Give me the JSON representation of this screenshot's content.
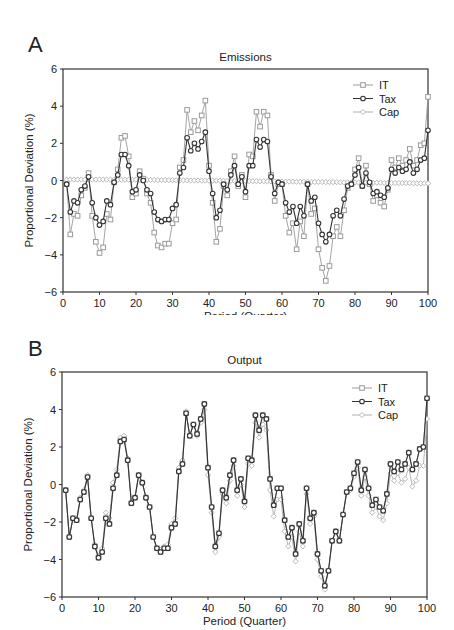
{
  "chart_data": [
    {
      "panel": "A",
      "type": "line",
      "title": "Emissions",
      "xlabel": "Period (Quarter)",
      "ylabel": "Proportional Deviation (%)",
      "xlim": [
        0,
        100
      ],
      "ylim": [
        -6,
        6
      ],
      "xticks": [
        0,
        10,
        20,
        30,
        40,
        50,
        60,
        70,
        80,
        90,
        100
      ],
      "yticks": [
        -6,
        -4,
        -2,
        0,
        2,
        4,
        6
      ],
      "grid": false,
      "legend_position": "upper right",
      "x": [
        1,
        2,
        3,
        4,
        5,
        6,
        7,
        8,
        9,
        10,
        11,
        12,
        13,
        14,
        15,
        16,
        17,
        18,
        19,
        20,
        21,
        22,
        23,
        24,
        25,
        26,
        27,
        28,
        29,
        30,
        31,
        32,
        33,
        34,
        35,
        36,
        37,
        38,
        39,
        40,
        41,
        42,
        43,
        44,
        45,
        46,
        47,
        48,
        49,
        50,
        51,
        52,
        53,
        54,
        55,
        56,
        57,
        58,
        59,
        60,
        61,
        62,
        63,
        64,
        65,
        66,
        67,
        68,
        69,
        70,
        71,
        72,
        73,
        74,
        75,
        76,
        77,
        78,
        79,
        80,
        81,
        82,
        83,
        84,
        85,
        86,
        87,
        88,
        89,
        90,
        91,
        92,
        93,
        94,
        95,
        96,
        97,
        98,
        99,
        100
      ],
      "series": [
        {
          "name": "IT",
          "marker": "square",
          "color": "#9a9a9a",
          "values": [
            -0.2,
            -2.9,
            -1.8,
            -1.9,
            -0.8,
            -0.4,
            0.4,
            -1.9,
            -3.3,
            -3.9,
            -3.6,
            -1.8,
            -2.1,
            -0.1,
            0.6,
            2.3,
            2.4,
            1.3,
            -0.9,
            -0.7,
            0.5,
            0.1,
            -0.7,
            -1.2,
            -2.8,
            -3.5,
            -3.6,
            -3.4,
            -3.4,
            -2.3,
            -2.1,
            0.7,
            1.1,
            3.8,
            2.6,
            3.2,
            2.7,
            3.5,
            4.3,
            0.8,
            -1.2,
            -3.3,
            -2.6,
            -0.3,
            -0.8,
            0.5,
            1.3,
            -0.3,
            0.3,
            -0.9,
            1.4,
            1.3,
            3.7,
            2.9,
            3.7,
            3.5,
            0.3,
            -1.1,
            -0.2,
            -0.2,
            -1.9,
            -2.8,
            -2.3,
            -3.7,
            -2.2,
            -3.0,
            -0.2,
            -1.8,
            -1.5,
            -3.7,
            -4.7,
            -5.4,
            -4.6,
            -3.0,
            -2.5,
            -3.0,
            -1.6,
            -0.4,
            -0.2,
            0.6,
            1.2,
            -0.3,
            0.8,
            -0.2,
            -1.1,
            -0.8,
            -1.2,
            -1.4,
            -0.5,
            1.1,
            0.7,
            1.2,
            0.8,
            1.1,
            1.7,
            0.8,
            1.1,
            1.9,
            2.0,
            4.5
          ]
        },
        {
          "name": "Tax",
          "marker": "circle",
          "color": "#333333",
          "values": [
            -0.2,
            -1.7,
            -1.1,
            -1.2,
            -0.5,
            -0.3,
            0.2,
            -1.2,
            -2.0,
            -2.4,
            -2.2,
            -1.1,
            -1.3,
            -0.1,
            0.3,
            1.4,
            1.4,
            0.8,
            -0.6,
            -0.5,
            0.3,
            0.0,
            -0.5,
            -0.7,
            -1.7,
            -2.1,
            -2.2,
            -2.1,
            -2.1,
            -1.5,
            -1.3,
            0.4,
            0.7,
            2.3,
            1.6,
            2.0,
            1.7,
            2.1,
            2.6,
            0.5,
            -0.7,
            -2.0,
            -1.6,
            -0.2,
            -0.5,
            0.3,
            0.8,
            -0.2,
            0.2,
            -0.6,
            0.8,
            0.8,
            2.2,
            1.8,
            2.2,
            2.1,
            0.2,
            -0.7,
            -0.1,
            -0.2,
            -1.2,
            -1.7,
            -1.4,
            -2.3,
            -1.4,
            -1.9,
            -0.2,
            -1.1,
            -0.9,
            -2.3,
            -2.9,
            -3.3,
            -2.9,
            -1.9,
            -1.6,
            -1.9,
            -1.0,
            -0.3,
            -0.2,
            0.3,
            0.7,
            -0.3,
            0.4,
            -0.1,
            -0.7,
            -0.6,
            -0.8,
            -0.9,
            -0.4,
            0.6,
            0.4,
            0.7,
            0.5,
            0.6,
            1.0,
            0.4,
            0.6,
            1.1,
            1.2,
            2.7
          ]
        },
        {
          "name": "Cap",
          "marker": "diamond",
          "color": "#b0b0b0",
          "values": [
            0.05,
            0.05,
            0.05,
            0.05,
            0.05,
            0.05,
            0.05,
            0.05,
            0.05,
            0.05,
            0.05,
            0.05,
            0.05,
            0.04,
            0.04,
            0.04,
            0.04,
            0.04,
            0.04,
            0.04,
            0.03,
            0.03,
            0.03,
            0.03,
            0.03,
            0.02,
            0.02,
            0.02,
            0.02,
            0.02,
            0.01,
            0.01,
            0.01,
            0.01,
            0.0,
            0.0,
            0.0,
            0.0,
            0.0,
            -0.01,
            -0.01,
            -0.01,
            -0.01,
            -0.02,
            -0.02,
            -0.02,
            -0.02,
            -0.03,
            -0.03,
            -0.03,
            -0.03,
            -0.04,
            -0.04,
            -0.04,
            -0.04,
            -0.05,
            -0.05,
            -0.05,
            -0.05,
            -0.06,
            -0.06,
            -0.06,
            -0.06,
            -0.07,
            -0.07,
            -0.07,
            -0.07,
            -0.08,
            -0.08,
            -0.08,
            -0.08,
            -0.09,
            -0.09,
            -0.09,
            -0.09,
            -0.1,
            -0.1,
            -0.1,
            -0.1,
            -0.11,
            -0.11,
            -0.11,
            -0.11,
            -0.12,
            -0.12,
            -0.12,
            -0.12,
            -0.13,
            -0.13,
            -0.13,
            -0.13,
            -0.14,
            -0.14,
            -0.14,
            -0.14,
            -0.15,
            -0.15,
            -0.15,
            -0.15,
            -0.15
          ]
        }
      ]
    },
    {
      "panel": "B",
      "type": "line",
      "title": "Output",
      "xlabel": "Period (Quarter)",
      "ylabel": "Proportional Deviation (%)",
      "xlim": [
        0,
        100
      ],
      "ylim": [
        -6,
        6
      ],
      "xticks": [
        0,
        10,
        20,
        30,
        40,
        50,
        60,
        70,
        80,
        90,
        100
      ],
      "yticks": [
        -6,
        -4,
        -2,
        0,
        2,
        4,
        6
      ],
      "grid": false,
      "legend_position": "upper right",
      "x": [
        1,
        2,
        3,
        4,
        5,
        6,
        7,
        8,
        9,
        10,
        11,
        12,
        13,
        14,
        15,
        16,
        17,
        18,
        19,
        20,
        21,
        22,
        23,
        24,
        25,
        26,
        27,
        28,
        29,
        30,
        31,
        32,
        33,
        34,
        35,
        36,
        37,
        38,
        39,
        40,
        41,
        42,
        43,
        44,
        45,
        46,
        47,
        48,
        49,
        50,
        51,
        52,
        53,
        54,
        55,
        56,
        57,
        58,
        59,
        60,
        61,
        62,
        63,
        64,
        65,
        66,
        67,
        68,
        69,
        70,
        71,
        72,
        73,
        74,
        75,
        76,
        77,
        78,
        79,
        80,
        81,
        82,
        83,
        84,
        85,
        86,
        87,
        88,
        89,
        90,
        91,
        92,
        93,
        94,
        95,
        96,
        97,
        98,
        99,
        100
      ],
      "series": [
        {
          "name": "IT",
          "marker": "square",
          "color": "#9a9a9a",
          "values": [
            -0.3,
            -2.8,
            -1.8,
            -1.9,
            -0.8,
            -0.4,
            0.4,
            -1.8,
            -3.3,
            -3.9,
            -3.6,
            -1.8,
            -2.1,
            -0.2,
            0.5,
            2.3,
            2.4,
            1.3,
            -1.0,
            -0.7,
            0.5,
            0.1,
            -0.7,
            -1.2,
            -2.8,
            -3.4,
            -3.6,
            -3.4,
            -3.4,
            -2.3,
            -2.1,
            0.7,
            1.1,
            3.8,
            2.6,
            3.2,
            2.7,
            3.5,
            4.3,
            0.9,
            -1.2,
            -3.3,
            -2.6,
            -0.3,
            -0.7,
            0.5,
            1.3,
            -0.3,
            0.3,
            -0.9,
            1.4,
            1.3,
            3.7,
            2.9,
            3.7,
            3.5,
            0.3,
            -1.1,
            -0.2,
            -0.2,
            -1.9,
            -2.8,
            -2.3,
            -3.7,
            -2.1,
            -3.0,
            -0.2,
            -1.8,
            -1.5,
            -3.7,
            -4.6,
            -5.4,
            -4.6,
            -3.0,
            -2.5,
            -3.0,
            -1.6,
            -0.4,
            -0.2,
            0.6,
            1.2,
            -0.3,
            0.8,
            -0.2,
            -1.1,
            -0.8,
            -1.2,
            -1.4,
            -0.5,
            1.1,
            0.7,
            1.2,
            0.8,
            1.1,
            1.7,
            0.8,
            1.1,
            1.9,
            2.0,
            4.6
          ]
        },
        {
          "name": "Tax",
          "marker": "circle",
          "color": "#333333",
          "values": [
            -0.3,
            -2.8,
            -1.8,
            -1.9,
            -0.8,
            -0.4,
            0.4,
            -1.8,
            -3.3,
            -3.9,
            -3.6,
            -1.8,
            -2.1,
            -0.2,
            0.5,
            2.3,
            2.4,
            1.3,
            -1.0,
            -0.7,
            0.5,
            0.1,
            -0.7,
            -1.2,
            -2.8,
            -3.4,
            -3.6,
            -3.4,
            -3.4,
            -2.3,
            -2.1,
            0.7,
            1.1,
            3.8,
            2.6,
            3.2,
            2.7,
            3.5,
            4.3,
            0.9,
            -1.2,
            -3.3,
            -2.6,
            -0.3,
            -0.7,
            0.5,
            1.3,
            -0.3,
            0.3,
            -0.9,
            1.4,
            1.3,
            3.7,
            2.9,
            3.7,
            3.5,
            0.3,
            -1.1,
            -0.2,
            -0.2,
            -1.9,
            -2.8,
            -2.3,
            -3.7,
            -2.1,
            -3.0,
            -0.2,
            -1.8,
            -1.5,
            -3.7,
            -4.6,
            -5.4,
            -4.6,
            -3.0,
            -2.5,
            -3.0,
            -1.6,
            -0.4,
            -0.2,
            0.6,
            1.2,
            -0.3,
            0.8,
            -0.2,
            -1.1,
            -0.8,
            -1.2,
            -1.4,
            -0.5,
            1.1,
            0.7,
            1.2,
            0.8,
            1.1,
            1.7,
            0.8,
            1.1,
            1.9,
            2.0,
            4.6
          ]
        },
        {
          "name": "Cap",
          "marker": "diamond",
          "color": "#b0b0b0",
          "values": [
            -0.3,
            -2.8,
            -1.8,
            -1.9,
            -0.7,
            -0.3,
            0.5,
            -1.8,
            -3.2,
            -3.8,
            -3.4,
            -1.5,
            -1.8,
            0.1,
            0.8,
            2.5,
            2.6,
            1.4,
            -0.9,
            -0.7,
            0.5,
            0.1,
            -0.7,
            -1.2,
            -2.8,
            -3.4,
            -3.5,
            -3.3,
            -3.2,
            -2.1,
            -1.8,
            0.9,
            1.3,
            3.9,
            2.6,
            3.2,
            2.6,
            3.3,
            4.0,
            0.5,
            -1.5,
            -3.6,
            -2.8,
            -0.5,
            -1.0,
            0.2,
            1.0,
            -0.6,
            0.0,
            -1.2,
            1.1,
            1.0,
            3.3,
            2.5,
            3.2,
            2.9,
            -0.3,
            -1.7,
            -0.8,
            -0.8,
            -2.5,
            -3.3,
            -2.8,
            -4.1,
            -2.5,
            -3.3,
            -0.5,
            -2.1,
            -1.7,
            -4.0,
            -4.9,
            -5.6,
            -4.6,
            -3.0,
            -2.5,
            -3.0,
            -1.6,
            -0.4,
            -0.3,
            0.4,
            0.9,
            -0.6,
            0.4,
            -0.6,
            -1.5,
            -1.2,
            -1.7,
            -1.9,
            -1.0,
            0.6,
            0.2,
            0.6,
            0.1,
            0.3,
            0.9,
            -0.1,
            0.2,
            1.0,
            1.0,
            3.5
          ]
        }
      ]
    }
  ],
  "panels": {
    "a": {
      "letter": "A",
      "title": "Emissions",
      "xlabel": "Period (Quarter)",
      "ylabel": "Proportional Deviation (%)"
    },
    "b": {
      "letter": "B",
      "title": "Output",
      "xlabel": "Period (Quarter)",
      "ylabel": "Proportional Deviation (%)"
    }
  },
  "legend": [
    "IT",
    "Tax",
    "Cap"
  ],
  "colors": {
    "it": "#9a9a9a",
    "tax": "#333333",
    "cap": "#b0b0b0",
    "axis": "#333333"
  }
}
